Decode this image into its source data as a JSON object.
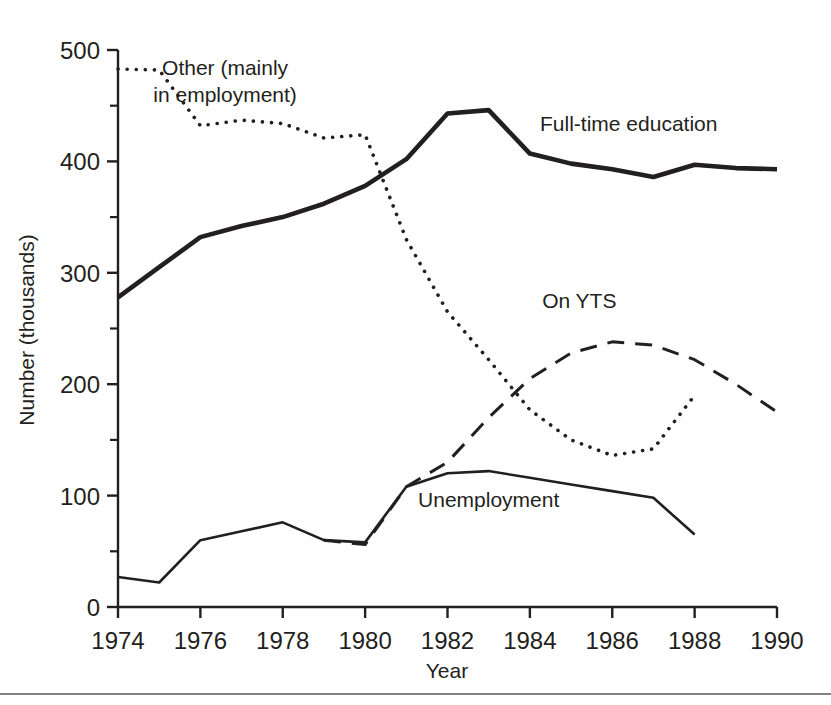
{
  "chart_data": {
    "type": "line",
    "title": "",
    "xlabel": "Year",
    "ylabel": "Number (thousands)",
    "xlim": [
      1974,
      1990
    ],
    "ylim": [
      0,
      500
    ],
    "xticks": [
      1974,
      1976,
      1978,
      1980,
      1982,
      1984,
      1986,
      1988,
      1990
    ],
    "xtick_labels": [
      "1974",
      "1976",
      "1978",
      "1980",
      "1982",
      "1984",
      "1986",
      "1988",
      "1990"
    ],
    "yticks": [
      0,
      100,
      200,
      300,
      400,
      500
    ],
    "ytick_labels": [
      "0",
      "100",
      "200",
      "300",
      "400",
      "500"
    ],
    "yminorticks": [
      50,
      150,
      250,
      350,
      450
    ],
    "grid": false,
    "legend_position": "inline-annotations",
    "x": [
      1974,
      1975,
      1976,
      1977,
      1978,
      1979,
      1980,
      1981,
      1982,
      1983,
      1984,
      1985,
      1986,
      1987,
      1988,
      1989,
      1990
    ],
    "series": [
      {
        "name": "Full-time education",
        "style": "solid-bold",
        "color": "#231f20",
        "x": [
          1974,
          1975,
          1976,
          1977,
          1978,
          1979,
          1980,
          1981,
          1982,
          1983,
          1984,
          1985,
          1986,
          1987,
          1988,
          1989,
          1990
        ],
        "values": [
          278,
          305,
          332,
          342,
          350,
          362,
          378,
          402,
          443,
          446,
          407,
          398,
          393,
          386,
          397,
          394,
          393
        ]
      },
      {
        "name": "Other (mainly in employment)",
        "style": "dotted",
        "color": "#231f20",
        "x": [
          1974,
          1975,
          1976,
          1977,
          1978,
          1979,
          1980,
          1981,
          1982,
          1983,
          1984,
          1985,
          1986,
          1987,
          1988
        ],
        "values": [
          483,
          482,
          432,
          437,
          434,
          421,
          424,
          330,
          265,
          222,
          177,
          150,
          136,
          142,
          190
        ]
      },
      {
        "name": "On YTS",
        "style": "dashed",
        "color": "#231f20",
        "x": [
          1979,
          1980,
          1981,
          1982,
          1983,
          1984,
          1985,
          1986,
          1987,
          1988,
          1989,
          1990
        ],
        "values": [
          60,
          56,
          108,
          130,
          170,
          205,
          228,
          238,
          235,
          222,
          200,
          175
        ]
      },
      {
        "name": "Unemployment",
        "style": "solid-thin",
        "color": "#231f20",
        "x": [
          1974,
          1975,
          1976,
          1977,
          1978,
          1979,
          1980,
          1981,
          1982,
          1983,
          1984,
          1985,
          1986,
          1987,
          1988
        ],
        "values": [
          27,
          22,
          60,
          68,
          76,
          60,
          58,
          108,
          120,
          122,
          116,
          110,
          104,
          98,
          65
        ]
      }
    ],
    "annotations": [
      {
        "text_line1": "Other (mainly",
        "text_line2": "in employment)",
        "x": 1976.6,
        "y": 478
      },
      {
        "text": "Full-time education",
        "x": 1986.4,
        "y": 427
      },
      {
        "text": "On YTS",
        "x": 1985.2,
        "y": 268
      },
      {
        "text": "Unemployment",
        "x": 1983.0,
        "y": 90
      }
    ]
  }
}
